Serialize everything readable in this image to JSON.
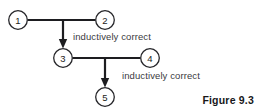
{
  "figure": {
    "caption": "Figure 9.3",
    "background_color": "#ffffff",
    "ink_color": "#1d1d20"
  },
  "diagram": {
    "type": "directed-graph",
    "nodes": [
      {
        "id": "1",
        "label": "1",
        "cx": 18,
        "cy": 20,
        "r": 9.5
      },
      {
        "id": "2",
        "label": "2",
        "cx": 105,
        "cy": 20,
        "r": 9.5
      },
      {
        "id": "3",
        "label": "3",
        "cx": 63,
        "cy": 58,
        "r": 9.5
      },
      {
        "id": "4",
        "label": "4",
        "cx": 150,
        "cy": 58,
        "r": 9.5
      },
      {
        "id": "5",
        "label": "5",
        "cx": 105,
        "cy": 97,
        "r": 9.5
      }
    ],
    "edges": [
      {
        "from": "1",
        "to": "2",
        "style": "plain-horizontal"
      },
      {
        "from": "1-2-branch",
        "to": "3",
        "style": "arrow-down"
      },
      {
        "from": "3",
        "to": "4",
        "style": "plain-horizontal"
      },
      {
        "from": "3-4-branch",
        "to": "5",
        "style": "arrow-down"
      }
    ],
    "labels": [
      {
        "id": "ind-1",
        "text": "inductively correct"
      },
      {
        "id": "ind-2",
        "text": "inductively correct"
      }
    ]
  }
}
